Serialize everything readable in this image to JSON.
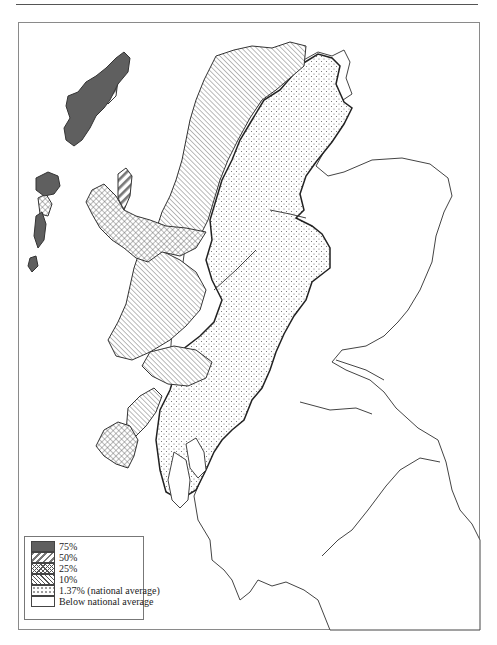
{
  "map": {
    "subject": "Scotland (Highlands and Islands)",
    "colors": {
      "p75": "#5f5f5f",
      "outline": "#333333",
      "boundary": "#222222",
      "frame": "#8a8a8a"
    }
  },
  "legend": {
    "items": [
      {
        "key": "p75",
        "pattern": "solid-dark",
        "label": "75%"
      },
      {
        "key": "p50",
        "pattern": "wide-diagonal",
        "label": "50%"
      },
      {
        "key": "p25",
        "pattern": "crosshatch",
        "label": "25%"
      },
      {
        "key": "p10",
        "pattern": "fine-diagonal",
        "label": "10%"
      },
      {
        "key": "p137",
        "pattern": "dots",
        "label": "1.37% (national average)"
      },
      {
        "key": "below",
        "pattern": "blank",
        "label": "Below national average"
      }
    ]
  }
}
